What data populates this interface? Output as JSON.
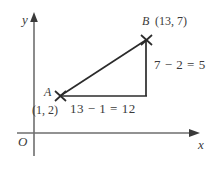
{
  "figure": {
    "type": "coordinate-geometry-diagram",
    "background_color": "#ffffff",
    "stroke_color": "#3a3a3a"
  },
  "axes": {
    "y_label": "y",
    "x_label": "x",
    "origin_label": "O"
  },
  "points": {
    "a": {
      "name": "A",
      "coord_label": "(1, 2)",
      "x": 1,
      "y": 2,
      "marker": "x-marker"
    },
    "b": {
      "name": "B",
      "coord_label": "(13, 7)",
      "x": 13,
      "y": 7,
      "marker": "x-marker"
    }
  },
  "legs": {
    "vertical_label": "7 − 2 = 5",
    "vertical_value": 5,
    "horizontal_label": "13 − 1 = 12",
    "horizontal_value": 12
  }
}
